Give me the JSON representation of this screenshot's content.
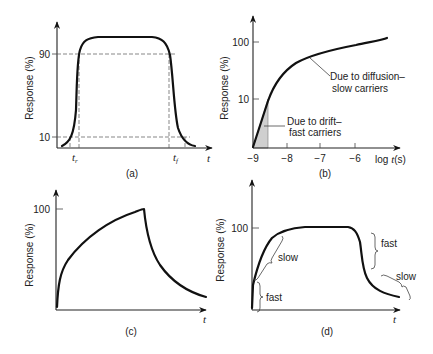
{
  "panels": {
    "a": {
      "caption": "(a)",
      "ylabel": "Response (%)",
      "y_ticks": [
        "90",
        "10"
      ],
      "x_marks": [
        "t_r",
        "t_f"
      ],
      "x_mark_labels": [
        "t",
        "t"
      ],
      "x_mark_subs": [
        "r",
        "f"
      ],
      "xaxis_label": "t"
    },
    "b": {
      "caption": "(b)",
      "ylabel": "Response (%)",
      "y_ticks": [
        "100",
        "10"
      ],
      "x_ticks": [
        "−9",
        "−8",
        "−7",
        "−6"
      ],
      "xaxis_label_pre": "log ",
      "xaxis_label_var": "t",
      "xaxis_label_post": "(s)",
      "annotation_diffusion_line1": "Due to diffusion–",
      "annotation_diffusion_line2": "slow carriers",
      "annotation_drift_line1": "Due to drift–",
      "annotation_drift_line2": "fast carriers"
    },
    "c": {
      "caption": "(c)",
      "ylabel": "Response (%)",
      "y_ticks": [
        "100"
      ],
      "xaxis_label": "t"
    },
    "d": {
      "caption": "(d)",
      "ylabel": "Response (%)",
      "y_ticks": [
        "100"
      ],
      "xaxis_label": "t",
      "labels": {
        "rise_fast": "fast",
        "rise_slow": "slow",
        "fall_fast": "fast",
        "fall_slow": "slow"
      }
    }
  }
}
